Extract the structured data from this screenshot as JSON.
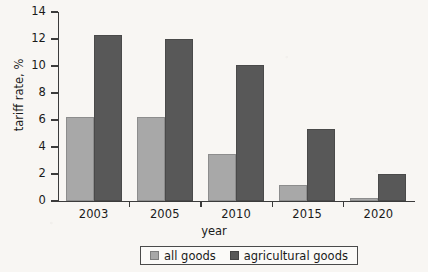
{
  "chart_data": {
    "type": "bar",
    "title": "",
    "subtitle": "",
    "xlabel": "year",
    "ylabel": "tariff rate, %",
    "categories": [
      "2003",
      "2005",
      "2010",
      "2015",
      "2020"
    ],
    "series": [
      {
        "name": "all goods",
        "color": "#a8a8a8",
        "values": [
          6.2,
          6.2,
          3.5,
          1.2,
          0.2
        ]
      },
      {
        "name": "agricultural goods",
        "color": "#585858",
        "values": [
          12.3,
          12.0,
          10.1,
          5.3,
          2.0
        ]
      }
    ],
    "ylim": [
      0,
      14
    ],
    "ytick_labels": [
      "0",
      "2",
      "4",
      "6",
      "8",
      "10",
      "12",
      "14"
    ],
    "ytick_values": [
      0,
      2,
      4,
      6,
      8,
      10,
      12,
      14
    ],
    "grid": false,
    "legend_position": "bottom-center",
    "legend_entries": [
      "all goods",
      "agricultural goods"
    ],
    "annotations": []
  },
  "colors": {
    "background": "#f8f6f3",
    "axis": "#3b3b3b",
    "text": "#1a1a1a",
    "series_all_goods": "#a8a8a8",
    "series_agricultural_goods": "#585858"
  }
}
